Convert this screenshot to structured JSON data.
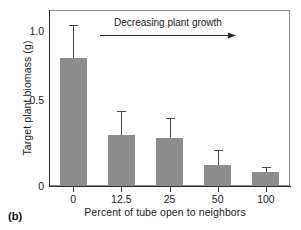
{
  "figure": {
    "panel_label": "(b)"
  },
  "chart_data": {
    "type": "bar",
    "title": "",
    "xlabel": "Percent of tube open to neighbors",
    "ylabel": "Target plant biomass (g)",
    "categories": [
      "0",
      "12.5",
      "25",
      "50",
      "100"
    ],
    "values": [
      0.8,
      0.32,
      0.3,
      0.13,
      0.09
    ],
    "error_upper": [
      1.0,
      0.46,
      0.42,
      0.22,
      0.11
    ],
    "ylim": [
      0,
      1.1
    ],
    "yticks": [
      "0",
      "0.5",
      "1.0"
    ],
    "ytick_values": [
      0,
      0.5,
      1.0
    ],
    "grid": false,
    "legend": "none",
    "bar_color": "#8d8d8d",
    "error_color": "#4a4a4a",
    "annotations": [
      {
        "text": "Decreasing plant growth",
        "arrow": "right"
      }
    ]
  }
}
